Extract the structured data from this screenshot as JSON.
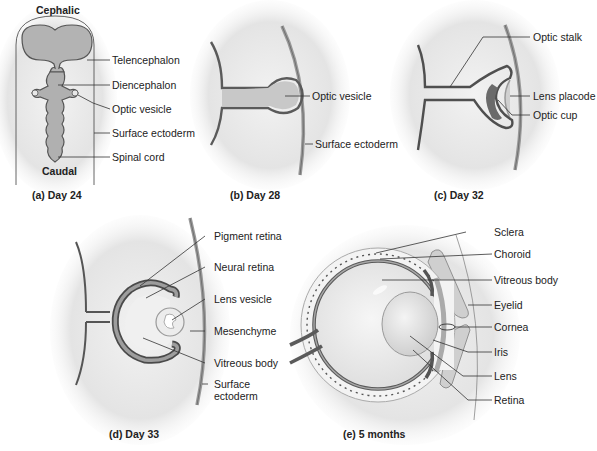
{
  "figure": {
    "panels": [
      {
        "id": "a",
        "caption": "(a) Day 24",
        "orientation": {
          "top": "Cephalic",
          "bottom": "Caudal"
        },
        "labels": [
          "Telencephalon",
          "Diencephalon",
          "Optic vesicle",
          "Surface ectoderm",
          "Spinal cord"
        ]
      },
      {
        "id": "b",
        "caption": "(b) Day 28",
        "labels": [
          "Optic vesicle",
          "Surface ectoderm"
        ]
      },
      {
        "id": "c",
        "caption": "(c) Day 32",
        "labels": [
          "Optic stalk",
          "Lens placode",
          "Optic cup"
        ]
      },
      {
        "id": "d",
        "caption": "(d) Day 33",
        "labels": [
          "Pigment retina",
          "Neural retina",
          "Lens vesicle",
          "Mesenchyme",
          "Vitreous body",
          "Surface",
          "ectoderm"
        ]
      },
      {
        "id": "e",
        "caption": "(e) 5 months",
        "labels": [
          "Sclera",
          "Choroid",
          "Vitreous body",
          "Eyelid",
          "Cornea",
          "Iris",
          "Lens",
          "Retina"
        ]
      }
    ],
    "colors": {
      "tissue_dark": "#5a5a5a",
      "tissue_mid": "#9a9a9a",
      "tissue_light": "#d8d8d8",
      "background_glow": "#e6e6e6",
      "leader_line": "#333333"
    }
  }
}
